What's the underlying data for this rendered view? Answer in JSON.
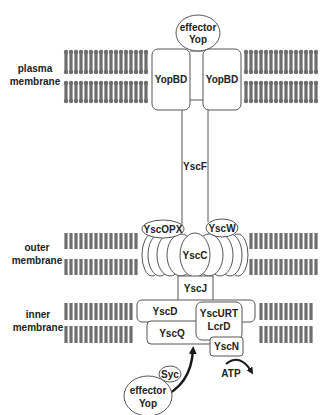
{
  "diagram": {
    "colors": {
      "lipid": "#6e6e6e",
      "outline": "#555555",
      "text": "#222222",
      "arrow": "#1a1a1a",
      "background": "#ffffff"
    },
    "membranes": [
      {
        "id": "plasma",
        "label_line1": "plasma",
        "label_line2": "membrane",
        "label_x": 35,
        "label_y": 72,
        "x_start": 66,
        "x_end": 318,
        "upper": [
          52,
          72
        ],
        "lower": [
          83,
          101
        ],
        "heads": true
      },
      {
        "id": "outer",
        "label_line1": "outer",
        "label_line2": "membrane",
        "label_x": 35,
        "label_y": 250,
        "x_start": 66,
        "x_end": 318,
        "upper": [
          233,
          249
        ],
        "lower": [
          259,
          275
        ],
        "heads": false
      },
      {
        "id": "inner",
        "label_line1": "inner",
        "label_line2": "membrane",
        "label_x": 40,
        "label_y": 316,
        "x_start": 66,
        "x_end": 315,
        "upper": [
          303,
          320
        ],
        "lower": [
          326,
          343
        ],
        "heads": false
      }
    ],
    "components": {
      "effector_top": {
        "line1": "effector",
        "line2": "Yop",
        "cx": 198,
        "cy": 33,
        "rx": 22,
        "ry": 18
      },
      "yopbd_left": {
        "label": "YopBD",
        "x": 152,
        "y": 49,
        "w": 38,
        "h": 61
      },
      "yopbd_right": {
        "label": "YopBD",
        "x": 203,
        "y": 49,
        "w": 38,
        "h": 61
      },
      "yscf": {
        "label": "YscF",
        "x_left": 182,
        "x_right": 208,
        "y_top": 110,
        "y_bottom": 226,
        "label_y": 167
      },
      "yscopx": {
        "label": "YscOPX",
        "cx": 163,
        "cy": 229,
        "rx": 21,
        "ry": 9
      },
      "yscw": {
        "label": "YscW",
        "cx": 222,
        "cy": 228,
        "rx": 16,
        "ry": 9
      },
      "yscc": {
        "label": "YscC",
        "x_min": 143,
        "x_max": 247,
        "y_top": 234,
        "y_bottom": 276,
        "label_y": 254
      },
      "yscj": {
        "label": "YscJ",
        "x": 178,
        "y": 276,
        "w": 35,
        "h": 25
      },
      "yscd": {
        "label": "YscD",
        "x": 137,
        "y": 300,
        "w": 118,
        "h": 22
      },
      "yscq": {
        "label": "YscQ",
        "x": 147,
        "y": 321,
        "w": 66,
        "h": 23
      },
      "yscurt": {
        "line1": "YscURT",
        "line2": "LcrD",
        "x": 196,
        "y": 302,
        "w": 46,
        "h": 38
      },
      "yscn": {
        "label": "YscN",
        "x": 210,
        "y": 337,
        "w": 33,
        "h": 19
      },
      "syc": {
        "label": "Syc",
        "cx": 170,
        "cy": 374,
        "rx": 11,
        "ry": 8
      },
      "effector_bottom": {
        "line1": "effector",
        "line2": "Yop",
        "cx": 148,
        "cy": 396,
        "rx": 24,
        "ry": 20
      },
      "atp": {
        "label": "ATP",
        "x": 232,
        "y": 371
      }
    }
  }
}
